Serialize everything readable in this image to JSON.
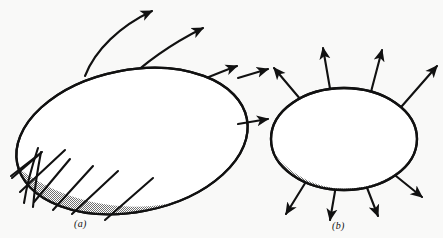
{
  "figure": {
    "background_color": "#f9f9f8",
    "ink_color": "#111111",
    "shade_color": "#a9a9a9",
    "surface_fill": "#ffffff"
  },
  "panels": [
    {
      "id": "a",
      "label": "(a)",
      "caption_style": "italic-serif",
      "description": "Closed ellipsoidal surface with curved field lines; lines enter at lower left and exit at upper right",
      "surface": {
        "shape": "ellipse",
        "center_x": 132,
        "center_y": 141,
        "radius_x": 117,
        "radius_y": 71,
        "rotation_deg": -11,
        "shaded_band": "lower-crescent"
      },
      "field_lines": [
        {
          "name": "curve-exit-1",
          "kind": "curved",
          "arrowhead": true,
          "exit_point": "top"
        },
        {
          "name": "curve-exit-2",
          "kind": "curved",
          "arrowhead": true,
          "exit_point": "top-right"
        },
        {
          "name": "curve-exit-3",
          "kind": "curved",
          "arrowhead": true,
          "exit_point": "right-upper"
        },
        {
          "name": "curve-exit-4",
          "kind": "curved",
          "arrowhead": true,
          "exit_point": "right-lower"
        },
        {
          "name": "line-enter-1",
          "kind": "straight",
          "arrowhead": false,
          "entry_point": "lower-left"
        },
        {
          "name": "line-enter-2",
          "kind": "straight",
          "arrowhead": false,
          "entry_point": "lower-left"
        },
        {
          "name": "line-enter-3",
          "kind": "straight",
          "arrowhead": false,
          "entry_point": "bottom-left"
        },
        {
          "name": "line-enter-4",
          "kind": "straight",
          "arrowhead": false,
          "entry_point": "bottom-left"
        },
        {
          "name": "line-enter-5",
          "kind": "straight",
          "arrowhead": false,
          "entry_point": "bottom"
        }
      ],
      "arrow_count": 4,
      "plain_line_count": 5
    },
    {
      "id": "b",
      "label": "(b)",
      "caption_style": "italic-serif",
      "description": "Closed ellipsoidal surface with straight radial arrows pointing outward in all directions",
      "surface": {
        "shape": "ellipse",
        "center_x": 344,
        "center_y": 139,
        "radius_x": 73,
        "radius_y": 51,
        "rotation_deg": 0,
        "shaded_band": "lower-crescent"
      },
      "field_lines": [
        {
          "name": "radial-arrow-top-1",
          "kind": "straight",
          "arrowhead": true,
          "direction_deg": 200
        },
        {
          "name": "radial-arrow-top-2",
          "kind": "straight",
          "arrowhead": true,
          "direction_deg": 260
        },
        {
          "name": "radial-arrow-top-3",
          "kind": "straight",
          "arrowhead": true,
          "direction_deg": 280
        },
        {
          "name": "radial-arrow-top-4",
          "kind": "straight",
          "arrowhead": true,
          "direction_deg": 320
        },
        {
          "name": "radial-arrow-bottom-1",
          "kind": "straight",
          "arrowhead": true,
          "direction_deg": 120
        },
        {
          "name": "radial-arrow-bottom-2",
          "kind": "straight",
          "arrowhead": true,
          "direction_deg": 90
        },
        {
          "name": "radial-arrow-bottom-3",
          "kind": "straight",
          "arrowhead": true,
          "direction_deg": 60
        },
        {
          "name": "radial-arrow-bottom-4",
          "kind": "straight",
          "arrowhead": true,
          "direction_deg": 30
        }
      ],
      "arrow_count": 8,
      "plain_line_count": 0
    }
  ]
}
